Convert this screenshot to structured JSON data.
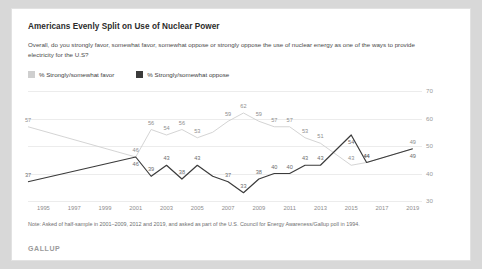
{
  "title": "Americans Evenly Split on Use of Nuclear Power",
  "subtitle": "Overall, do you strongly favor, somewhat favor, somewhat oppose or strongly oppose the use of nuclear energy as one of the ways to provide electricity for the U.S?",
  "legend": [
    {
      "label": "% Strongly/somewhat favor",
      "color": "#cfcfcf",
      "key": "favor"
    },
    {
      "label": "% Strongly/somewhat oppose",
      "color": "#3b3b3b",
      "key": "oppose"
    }
  ],
  "note": "Note: Asked of half-sample in 2001–2009, 2012 and 2019, and asked as part of the U.S. Council for Energy Awareness/Gallup poll in 1994.",
  "brand": "GALLUP",
  "chart_data": {
    "type": "line",
    "title": "Americans Evenly Split on Use of Nuclear Power",
    "subtitle": "Overall, do you strongly favor, somewhat favor, somewhat oppose or strongly oppose the use of nuclear energy as one of the ways to provide electricity for the U.S?",
    "xlabel": "",
    "ylabel": "",
    "ylim": [
      30,
      70
    ],
    "yticks": [
      30,
      40,
      50,
      60,
      70
    ],
    "grid": true,
    "legend_position": "top-left",
    "xticks": [
      "1995",
      "1997",
      "1999",
      "2001",
      "2003",
      "2005",
      "2007",
      "2009",
      "2011",
      "2013",
      "2015",
      "2017",
      "2019"
    ],
    "x": [
      1994,
      2001,
      2002,
      2003,
      2004,
      2005,
      2006,
      2007,
      2008,
      2009,
      2010,
      2011,
      2012,
      2013,
      2015,
      2016,
      2019
    ],
    "series": [
      {
        "name": "% Strongly/somewhat favor",
        "color": "#cfcfcf",
        "values": [
          57,
          46,
          56,
          54,
          56,
          53,
          55,
          59,
          62,
          59,
          57,
          57,
          53,
          51,
          43,
          44,
          49
        ]
      },
      {
        "name": "% Strongly/somewhat oppose",
        "color": "#3b3b3b",
        "values": [
          37,
          46,
          39,
          43,
          38,
          43,
          39,
          37,
          33,
          38,
          40,
          40,
          43,
          43,
          54,
          44,
          49
        ]
      }
    ],
    "point_labels": {
      "favor": [
        57,
        46,
        56,
        54,
        56,
        53,
        null,
        59,
        62,
        59,
        57,
        57,
        53,
        51,
        43,
        44,
        49
      ],
      "oppose": [
        37,
        46,
        39,
        43,
        38,
        43,
        null,
        37,
        33,
        38,
        40,
        40,
        43,
        43,
        54,
        44,
        49
      ]
    }
  }
}
